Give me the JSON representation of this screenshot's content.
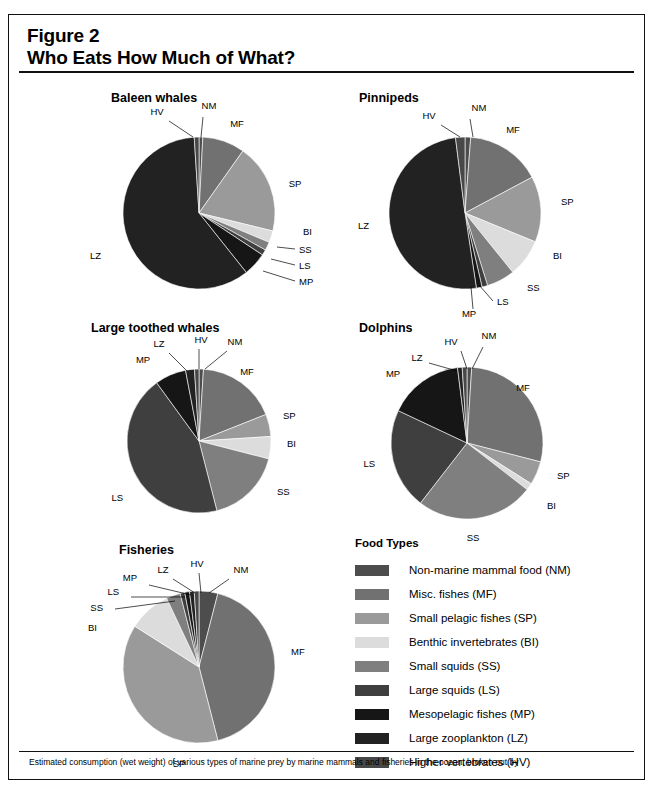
{
  "figure": {
    "number": "Figure 2",
    "title": "Who Eats How Much of What?",
    "caption": "Estimated consumption (wet weight) of various types of marine prey by marine mammals and fisheries in the ocean, broken out by"
  },
  "legend": {
    "title": "Food Types",
    "items": [
      {
        "code": "NM",
        "label": "Non-marine mammal food (NM)",
        "color": "#4d4d4d"
      },
      {
        "code": "MF",
        "label": "Misc. fishes (MF)",
        "color": "#717171"
      },
      {
        "code": "SP",
        "label": "Small pelagic fishes (SP)",
        "color": "#9a9a9a"
      },
      {
        "code": "BI",
        "label": "Benthic invertebrates (BI)",
        "color": "#dcdcdc"
      },
      {
        "code": "SS",
        "label": "Small squids (SS)",
        "color": "#7f7f7f"
      },
      {
        "code": "LS",
        "label": "Large squids (LS)",
        "color": "#3f3f3f"
      },
      {
        "code": "MP",
        "label": "Mesopelagic fishes (MP)",
        "color": "#161616"
      },
      {
        "code": "LZ",
        "label": "Large zooplankton (LZ)",
        "color": "#222222"
      },
      {
        "code": "HV",
        "label": "Higher vertebrates (HV)",
        "color": "#484848"
      }
    ]
  },
  "chart_data": [
    {
      "type": "pie",
      "title": "Baleen whales",
      "categories": [
        "NM",
        "MF",
        "SP",
        "BI",
        "SS",
        "LS",
        "MP",
        "LZ",
        "HV"
      ],
      "values": [
        0.8,
        9.0,
        19.0,
        2.5,
        1.8,
        1.2,
        5.0,
        59.7,
        1.0
      ],
      "unit": "percent of diet",
      "startangle": 90,
      "direction": "clockwise",
      "legend": "shared"
    },
    {
      "type": "pie",
      "title": "Pinnipeds",
      "categories": [
        "NM",
        "MF",
        "SP",
        "BI",
        "SS",
        "LS",
        "MP",
        "LZ",
        "HV"
      ],
      "values": [
        1.2,
        16.0,
        14.0,
        8.0,
        6.0,
        1.2,
        1.2,
        50.4,
        2.0
      ],
      "unit": "percent of diet",
      "startangle": 90,
      "direction": "clockwise",
      "legend": "shared"
    },
    {
      "type": "pie",
      "title": "Large toothed whales",
      "categories": [
        "NM",
        "MF",
        "SP",
        "BI",
        "SS",
        "LS",
        "MP",
        "LZ",
        "HV"
      ],
      "values": [
        1.0,
        18.0,
        5.0,
        5.0,
        17.0,
        44.0,
        7.0,
        2.0,
        1.0
      ],
      "unit": "percent of diet",
      "startangle": 90,
      "direction": "clockwise",
      "legend": "shared"
    },
    {
      "type": "pie",
      "title": "Dolphins",
      "categories": [
        "NM",
        "MF",
        "SP",
        "BI",
        "SS",
        "LS",
        "MP",
        "LZ",
        "HV"
      ],
      "values": [
        1.0,
        28.0,
        5.0,
        1.5,
        25.0,
        21.5,
        16.0,
        1.0,
        1.0
      ],
      "unit": "percent of diet",
      "startangle": 90,
      "direction": "clockwise",
      "legend": "shared"
    },
    {
      "type": "pie",
      "title": "Fisheries",
      "categories": [
        "NM",
        "MF",
        "SP",
        "BI",
        "SS",
        "LS",
        "MP",
        "LZ",
        "HV"
      ],
      "values": [
        4.0,
        42.0,
        38.0,
        9.0,
        3.0,
        1.0,
        1.0,
        1.0,
        1.0
      ],
      "unit": "percent of landings",
      "startangle": 90,
      "direction": "clockwise",
      "legend": "shared"
    }
  ],
  "panels": {
    "baleen": {
      "x": 72,
      "y": 76,
      "cx": 118,
      "cy": 108,
      "r": 76,
      "title_x": 30
    },
    "pinnipeds": {
      "x": 338,
      "y": 76,
      "cx": 118,
      "cy": 108,
      "r": 76,
      "title_x": 12
    },
    "largetooth": {
      "x": 62,
      "y": 306,
      "cx": 128,
      "cy": 106,
      "r": 72,
      "title_x": 20
    },
    "dolphins": {
      "x": 338,
      "y": 306,
      "cx": 120,
      "cy": 108,
      "r": 76,
      "title_x": 12
    },
    "fisheries": {
      "x": 62,
      "y": 528,
      "cx": 128,
      "cy": 110,
      "r": 76,
      "title_x": 48
    }
  }
}
